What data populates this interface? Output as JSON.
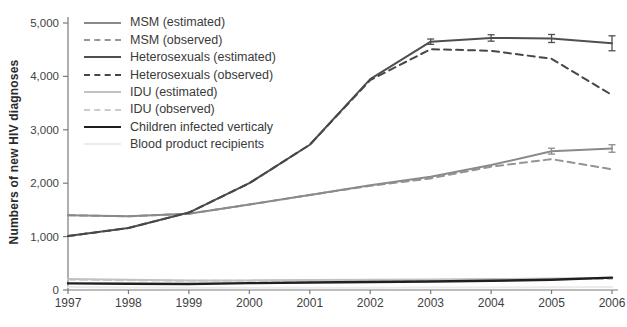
{
  "chart_data": {
    "type": "line",
    "title": "",
    "xlabel": "",
    "ylabel": "Numbers of new HIV diagnoses",
    "x": [
      1997,
      1998,
      1999,
      2000,
      2001,
      2002,
      2003,
      2004,
      2005,
      2006
    ],
    "xtick_labels": [
      "1997",
      "1998",
      "1999",
      "2000",
      "2001",
      "2002",
      "2003",
      "2004",
      "2005",
      "2006"
    ],
    "yticks": [
      0,
      1000,
      2000,
      3000,
      4000,
      5000
    ],
    "ytick_labels": [
      "0",
      "1,000",
      "2,000",
      "3,000",
      "4,000",
      "5,000"
    ],
    "ylim": [
      0,
      5000
    ],
    "grid": false,
    "legend_position": "upper-left-inside",
    "axis_color": "#7a7a7a",
    "series": [
      {
        "name": "MSM (estimated)",
        "style": "solid",
        "color": "#8a8a8a",
        "width": 2,
        "values": [
          1400,
          1380,
          1430,
          1600,
          1780,
          1960,
          2120,
          2340,
          2600,
          2650
        ],
        "error_bars": [
          {
            "x": 2005,
            "y": 2600,
            "e": 55
          },
          {
            "x": 2006,
            "y": 2650,
            "e": 70
          }
        ]
      },
      {
        "name": "MSM (observed)",
        "style": "dashed",
        "color": "#949494",
        "width": 2,
        "values": [
          1400,
          1380,
          1430,
          1600,
          1780,
          1950,
          2090,
          2310,
          2450,
          2260
        ],
        "error_bars": []
      },
      {
        "name": "Heterosexuals (estimated)",
        "style": "solid",
        "color": "#4f4f4f",
        "width": 2,
        "values": [
          1010,
          1160,
          1450,
          2000,
          2720,
          3950,
          4650,
          4720,
          4710,
          4620
        ],
        "error_bars": [
          {
            "x": 2003,
            "y": 4650,
            "e": 50
          },
          {
            "x": 2004,
            "y": 4720,
            "e": 60
          },
          {
            "x": 2005,
            "y": 4710,
            "e": 75
          },
          {
            "x": 2006,
            "y": 4620,
            "e": 140
          }
        ]
      },
      {
        "name": "Heterosexuals (observed)",
        "style": "dashed",
        "color": "#474747",
        "width": 2,
        "values": [
          1010,
          1160,
          1450,
          2000,
          2720,
          3930,
          4510,
          4480,
          4330,
          3650
        ],
        "error_bars": []
      },
      {
        "name": "IDU (estimated)",
        "style": "solid",
        "color": "#c2c2c2",
        "width": 2,
        "values": [
          205,
          190,
          180,
          180,
          185,
          190,
          195,
          205,
          215,
          225
        ],
        "error_bars": []
      },
      {
        "name": "IDU (observed)",
        "style": "dashed",
        "color": "#cbcbcb",
        "width": 2,
        "values": [
          195,
          182,
          172,
          172,
          177,
          182,
          187,
          197,
          207,
          205
        ],
        "error_bars": []
      },
      {
        "name": "Children infected verticaly",
        "style": "solid",
        "color": "#1f1f1f",
        "width": 2.4,
        "values": [
          125,
          118,
          112,
          128,
          140,
          150,
          160,
          172,
          192,
          232
        ],
        "error_bars": []
      },
      {
        "name": "Blood product recipients",
        "style": "solid",
        "color": "#ebebeb",
        "width": 2,
        "values": [
          55,
          48,
          42,
          40,
          40,
          42,
          45,
          48,
          52,
          55
        ],
        "error_bars": []
      }
    ]
  }
}
